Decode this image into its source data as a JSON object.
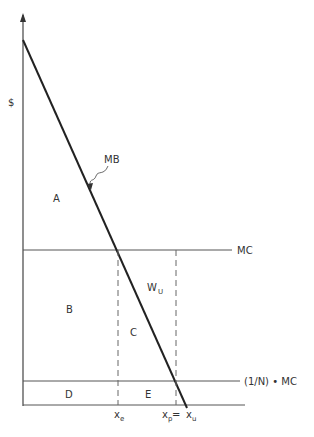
{
  "diagram": {
    "y_axis_label": "$",
    "curves": {
      "mb": "MB",
      "mc": "MC",
      "mc_share": "(1/N) • MC"
    },
    "regions": {
      "a": "A",
      "b": "B",
      "c": "C",
      "d": "D",
      "e": "E",
      "wu_main": "W",
      "wu_sub": "U"
    },
    "x_ticks": {
      "xe_main": "x",
      "xe_sub": "e",
      "xp_main": "x",
      "xp_sub": "p",
      "eq": " = ",
      "xu_main": "x",
      "xu_sub": "u"
    },
    "colors": {
      "axis": "#333333",
      "mb_line": "#222222",
      "mc_line": "#555555",
      "dashed": "#666666"
    }
  }
}
